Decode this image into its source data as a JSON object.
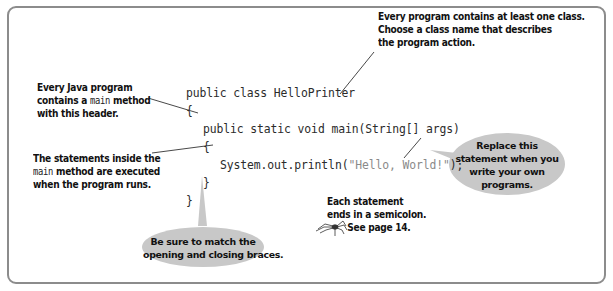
{
  "code": {
    "lines": [
      "public class HelloPrinter",
      "{",
      "public static void main(String[] args)",
      "{",
      "System.out.println(",
      "\"Hello, World!\"",
      ");",
      "}",
      "}"
    ],
    "class_decl": "public class HelloPrinter",
    "open_brace_class": "{",
    "main_decl": "public static void main(String[] args)",
    "open_brace_main": "{",
    "print_call": "System.out.println(",
    "print_string": "\"Hello, World!\"",
    "print_end": ");",
    "close_brace_main": "}",
    "close_brace_class": "}"
  },
  "annotations": {
    "class_note": {
      "line1": "Every program contains at least one class.",
      "line2": "Choose a class name that describes",
      "line3": "the program action."
    },
    "main_header_note": {
      "line1": "Every Java program",
      "line2_pre": "contains a ",
      "line2_code": "main",
      "line2_post": " method",
      "line3": "with this header."
    },
    "statements_note": {
      "line1": "The statements inside the",
      "line2_code": "main",
      "line2_post": " method are executed",
      "line3": "when the program runs."
    },
    "semicolon_note": {
      "line1": "Each statement",
      "line2": "ends in a semicolon.",
      "line3": "See page 14.",
      "icon": "spider-icon"
    },
    "braces_bubble": {
      "line1": "Be sure to match the",
      "line2": "opening and closing braces."
    },
    "replace_bubble": {
      "line1": "Replace this",
      "line2": "statement when you",
      "line3": "write your own",
      "line4": "programs."
    }
  },
  "colors": {
    "frame_border": "#8c8c8c",
    "bubble_fill": "#c8c8c8",
    "code_text": "#2b2b2b",
    "string_literal": "#8a8a8a",
    "leader_lines": "#333333"
  }
}
